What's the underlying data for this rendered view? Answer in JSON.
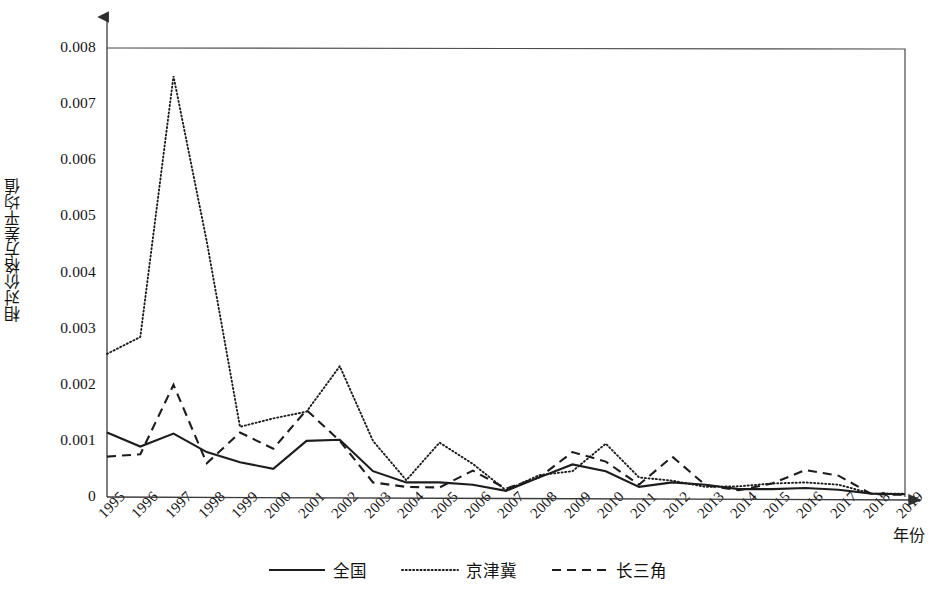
{
  "chart_data": {
    "type": "line",
    "title": "",
    "xlabel": "年份",
    "ylabel": "相对价格方差平均值",
    "x": [
      1995,
      1996,
      1997,
      1998,
      1999,
      2000,
      2001,
      2002,
      2003,
      2004,
      2005,
      2006,
      2007,
      2008,
      2009,
      2010,
      2011,
      2012,
      2013,
      2014,
      2015,
      2016,
      2017,
      2018,
      2019
    ],
    "categories": [
      "1995",
      "1996",
      "1997",
      "1998",
      "1999",
      "2000",
      "2001",
      "2002",
      "2003",
      "2004",
      "2005",
      "2006",
      "2007",
      "2008",
      "2009",
      "2010",
      "2011",
      "2012",
      "2013",
      "2014",
      "2015",
      "2016",
      "2017",
      "2018",
      "2019"
    ],
    "xlim": [
      1995,
      2019
    ],
    "ylim": [
      0,
      0.008
    ],
    "yticks": [
      0,
      0.001,
      0.002,
      0.003,
      0.004,
      0.005,
      0.006,
      0.007,
      0.008
    ],
    "ytick_labels": [
      "0",
      "0.001",
      "0.002",
      "0.003",
      "0.004",
      "0.005",
      "0.006",
      "0.007",
      "0.008"
    ],
    "grid": false,
    "legend_position": "bottom",
    "series": [
      {
        "name": "全国",
        "style": "solid",
        "color": "#1c1c1c",
        "values": [
          0.00115,
          0.0009,
          0.00113,
          0.0008,
          0.00062,
          0.0005,
          0.001,
          0.00102,
          0.00046,
          0.00026,
          0.00026,
          0.00022,
          0.00011,
          0.00035,
          0.00058,
          0.00046,
          0.00018,
          0.00026,
          0.00022,
          0.00014,
          0.00014,
          0.00016,
          0.00013,
          6e-05,
          5e-05
        ]
      },
      {
        "name": "京津冀",
        "style": "dotted",
        "color": "#1c1c1c",
        "values": [
          0.00255,
          0.00285,
          0.0075,
          0.00455,
          0.00125,
          0.0014,
          0.00152,
          0.00233,
          0.001,
          0.0003,
          0.00097,
          0.00059,
          0.00012,
          0.00039,
          0.00046,
          0.00095,
          0.00035,
          0.00029,
          0.00018,
          0.00019,
          0.00024,
          0.00026,
          0.00022,
          6e-05,
          6e-05
        ]
      },
      {
        "name": "长三角",
        "style": "dashed",
        "color": "#1c1c1c",
        "values": [
          0.00072,
          0.00076,
          0.002,
          0.0006,
          0.00115,
          0.00086,
          0.00155,
          0.001,
          0.00026,
          0.00018,
          0.00017,
          0.00047,
          0.00015,
          0.00035,
          0.0008,
          0.00063,
          0.00022,
          0.00072,
          0.00021,
          0.00012,
          0.00024,
          0.00048,
          0.00038,
          5e-05,
          4e-05
        ]
      }
    ]
  },
  "legend": {
    "items": [
      {
        "label": "全国",
        "style": "solid"
      },
      {
        "label": "京津冀",
        "style": "dotted"
      },
      {
        "label": "长三角",
        "style": "dashed"
      }
    ]
  },
  "axes": {
    "y_title": "相对价格方差平均值",
    "x_title": "年份"
  }
}
